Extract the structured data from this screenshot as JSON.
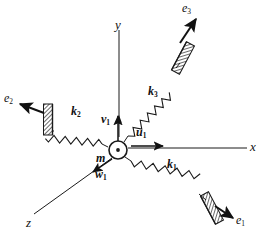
{
  "figure": {
    "kind": "free-body-diagram",
    "background_color": "#ffffff",
    "line_color": "#1a1a1a"
  },
  "axes": [
    {
      "name": "y-axis",
      "label": "y",
      "label_sub": "",
      "direction": "up",
      "tip_x": 119,
      "tip_y": 27,
      "tail_x": 119,
      "tail_y": 139,
      "arrow_at": "tail"
    },
    {
      "name": "x-axis",
      "label": "x",
      "label_sub": "",
      "direction": "right",
      "tip_x": 248,
      "tip_y": 148,
      "tail_x": 124,
      "tail_y": 148,
      "arrow_at": "none"
    },
    {
      "name": "z-axis",
      "label": "z",
      "label_sub": "",
      "direction": "down-left",
      "tip_x": 32,
      "tip_y": 216,
      "tail_x": 113,
      "tail_y": 157,
      "arrow_at": "none"
    }
  ],
  "axis_labels": {
    "y": "y",
    "x": "x",
    "z": "z"
  },
  "mass": {
    "label": "m",
    "marker": "circle-with-center-dot",
    "center_x": 118,
    "center_y": 150,
    "radius": 9
  },
  "springs": [
    {
      "name": "spring-k1",
      "label": "k",
      "sub": "1",
      "label_x": 170,
      "label_y": 163,
      "from_x": 126,
      "from_y": 158,
      "to_x": 209,
      "to_y": 205,
      "coils": 13
    },
    {
      "name": "spring-k2",
      "label": "k",
      "sub": "2",
      "label_x": 74,
      "label_y": 110,
      "from_x": 108,
      "from_y": 147,
      "to_x": 52,
      "to_y": 120,
      "coils": 10
    },
    {
      "name": "spring-k3",
      "label": "k",
      "sub": "3",
      "label_x": 150,
      "label_y": 89,
      "from_x": 124,
      "from_y": 141,
      "to_x": 180,
      "to_y": 62,
      "coils": 12
    }
  ],
  "supports": [
    {
      "name": "wall-right-lower",
      "hatched": true,
      "cx": 212,
      "cy": 208,
      "w": 9,
      "h": 30,
      "rotate": -28
    },
    {
      "name": "wall-left",
      "hatched": true,
      "cx": 48,
      "cy": 119,
      "w": 9,
      "h": 30,
      "rotate": 0
    },
    {
      "name": "wall-right-upper",
      "hatched": true,
      "cx": 183,
      "cy": 58,
      "w": 9,
      "h": 30,
      "rotate": 28
    }
  ],
  "excitation_arrows": [
    {
      "name": "e1-arrow",
      "label": "e",
      "sub": "1",
      "label_x": 238,
      "label_y": 221,
      "from_x": 215,
      "from_y": 207,
      "to_x": 234,
      "to_y": 219
    },
    {
      "name": "e2-arrow",
      "label": "e",
      "sub": "2",
      "label_x": 5,
      "label_y": 98,
      "from_x": 45,
      "from_y": 113,
      "to_x": 19,
      "to_y": 104
    },
    {
      "name": "e3-arrow",
      "label": "e",
      "sub": "3",
      "label_x": 184,
      "label_y": 4,
      "from_x": 180,
      "from_y": 42,
      "to_x": 196,
      "to_y": 18
    }
  ],
  "velocity_arrows": [
    {
      "name": "u1-arrow",
      "label": "u",
      "sub": "1",
      "label_x": 139,
      "label_y": 131,
      "from_x": 130,
      "from_y": 146,
      "to_x": 164,
      "to_y": 146,
      "bold_label": true
    },
    {
      "name": "v1-arrow",
      "label": "v",
      "sub": "1",
      "label_x": 103,
      "label_y": 118,
      "from_x": 118,
      "from_y": 140,
      "to_x": 118,
      "to_y": 114,
      "bold_label": true
    },
    {
      "name": "w1-arrow",
      "label": "w",
      "sub": "1",
      "label_x": 98,
      "label_y": 172,
      "from_x": 112,
      "from_y": 159,
      "to_x": 92,
      "to_y": 173,
      "bold_label": true
    }
  ]
}
